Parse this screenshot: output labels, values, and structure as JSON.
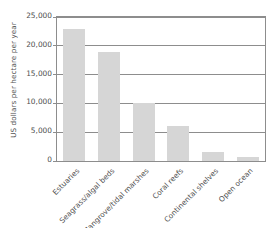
{
  "chart_data": {
    "type": "bar",
    "title": "",
    "subtitle": "",
    "xlabel": "",
    "ylabel": "US dollars per hectare per year",
    "categories": [
      "Estuaries",
      "Seagrass/algal beds",
      "Mangrove/tidal marshes",
      "Coral reefs",
      "Continental shelves",
      "Open ocean"
    ],
    "values": [
      22900,
      19000,
      10000,
      6100,
      1500,
      700
    ],
    "ylim": [
      0,
      25000
    ],
    "ytick_values": [
      0,
      5000,
      10000,
      15000,
      20000,
      25000
    ],
    "ytick_labels": [
      "0",
      "5,000",
      "10,000",
      "15,000",
      "20,000",
      "25,000"
    ],
    "grid": true,
    "grid_axis": "y",
    "legend": false,
    "legend_position": "none",
    "bar_color": "#d6d6d6",
    "axis_color": "#8d8d8d",
    "text_color": "#4f4f4f",
    "background_color": "#ffffff",
    "xtick_label_rotation": 45
  }
}
